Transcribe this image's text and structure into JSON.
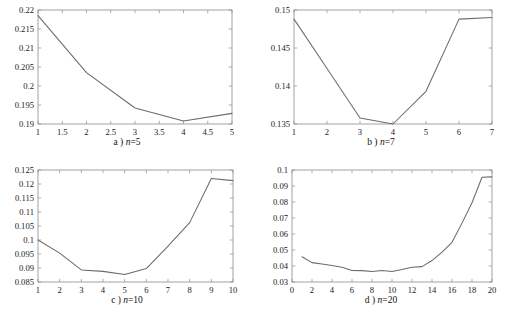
{
  "figure": {
    "background_color": "#ffffff",
    "line_color": "#6b6b6b",
    "axis_color": "#8c8c8c"
  },
  "chart_data": [
    {
      "id": "a",
      "type": "line",
      "title": "",
      "caption_prefix": "a ) ",
      "caption_var": "n",
      "caption_suffix": "=5",
      "caption": "a ) n=5",
      "xlabel": "",
      "ylabel": "",
      "xlim": [
        1,
        5
      ],
      "ylim": [
        0.19,
        0.22
      ],
      "xticks": [
        1,
        1.5,
        2,
        2.5,
        3,
        3.5,
        4,
        4.5,
        5
      ],
      "xticklabels": [
        "1",
        "1.5",
        "2",
        "2.5",
        "3",
        "3.5",
        "4",
        "4.5",
        "5"
      ],
      "yticks": [
        0.19,
        0.195,
        0.2,
        0.205,
        0.21,
        0.215,
        0.22
      ],
      "yticklabels": [
        "0.19",
        "0.195",
        "0.2",
        "0.205",
        "0.21",
        "0.215",
        "0.22"
      ],
      "grid": false,
      "legend": null,
      "x": [
        1,
        2,
        3,
        4,
        5
      ],
      "values": [
        0.2185,
        0.2035,
        0.1942,
        0.1908,
        0.1928
      ]
    },
    {
      "id": "b",
      "type": "line",
      "title": "",
      "caption_prefix": "b ) ",
      "caption_var": "n",
      "caption_suffix": "=7",
      "caption": "b ) n=7",
      "xlabel": "",
      "ylabel": "",
      "xlim": [
        1,
        7
      ],
      "ylim": [
        0.135,
        0.15
      ],
      "xticks": [
        1,
        2,
        3,
        4,
        5,
        6,
        7
      ],
      "xticklabels": [
        "1",
        "2",
        "3",
        "4",
        "5",
        "6",
        "7"
      ],
      "yticks": [
        0.135,
        0.14,
        0.145,
        0.15
      ],
      "yticklabels": [
        "0.135",
        "0.14",
        "0.145",
        "0.15"
      ],
      "grid": false,
      "legend": null,
      "x": [
        1,
        2,
        3,
        4,
        5,
        6,
        7
      ],
      "values": [
        0.1488,
        0.1423,
        0.1358,
        0.135,
        0.1393,
        0.1488,
        0.149
      ]
    },
    {
      "id": "c",
      "type": "line",
      "title": "",
      "caption_prefix": "c ) ",
      "caption_var": "n",
      "caption_suffix": "=10",
      "caption": "c ) n=10",
      "xlabel": "",
      "ylabel": "",
      "xlim": [
        1,
        10
      ],
      "ylim": [
        0.085,
        0.125
      ],
      "xticks": [
        1,
        2,
        3,
        4,
        5,
        6,
        7,
        8,
        9,
        10
      ],
      "xticklabels": [
        "1",
        "2",
        "3",
        "4",
        "5",
        "6",
        "7",
        "8",
        "9",
        "10"
      ],
      "yticks": [
        0.085,
        0.09,
        0.095,
        0.1,
        0.105,
        0.11,
        0.115,
        0.12,
        0.125
      ],
      "yticklabels": [
        "0.085",
        "0.09",
        "0.095",
        "0.1",
        "0.105",
        "0.11",
        "0.115",
        "0.12",
        "0.125"
      ],
      "grid": false,
      "legend": null,
      "x": [
        1,
        2,
        3,
        4,
        5,
        6,
        7,
        8,
        9,
        10
      ],
      "values": [
        0.1,
        0.0953,
        0.0893,
        0.0888,
        0.0877,
        0.0898,
        0.0978,
        0.1062,
        0.122,
        0.1212
      ]
    },
    {
      "id": "d",
      "type": "line",
      "title": "",
      "caption_prefix": "d ) ",
      "caption_var": "n",
      "caption_suffix": "=20",
      "caption": "d ) n=20",
      "xlabel": "",
      "ylabel": "",
      "xlim": [
        0,
        20
      ],
      "ylim": [
        0.03,
        0.1
      ],
      "xticks": [
        0,
        2,
        4,
        6,
        8,
        10,
        12,
        14,
        16,
        18,
        20
      ],
      "xticklabels": [
        "0",
        "2",
        "4",
        "6",
        "8",
        "10",
        "12",
        "14",
        "16",
        "18",
        "20"
      ],
      "yticks": [
        0.03,
        0.04,
        0.05,
        0.06,
        0.07,
        0.08,
        0.09,
        0.1
      ],
      "yticklabels": [
        "0.03",
        "0.04",
        "0.05",
        "0.06",
        "0.07",
        "0.08",
        "0.09",
        "0.1"
      ],
      "grid": false,
      "legend": null,
      "x": [
        1,
        2,
        3,
        4,
        5,
        6,
        7,
        8,
        9,
        10,
        11,
        12,
        13,
        14,
        15,
        16,
        17,
        18,
        19,
        20
      ],
      "values": [
        0.0458,
        0.0421,
        0.0413,
        0.0403,
        0.0392,
        0.0372,
        0.0371,
        0.0365,
        0.0372,
        0.0366,
        0.0378,
        0.0392,
        0.0396,
        0.0434,
        0.0487,
        0.0548,
        0.0668,
        0.0795,
        0.0955,
        0.0957
      ]
    }
  ]
}
